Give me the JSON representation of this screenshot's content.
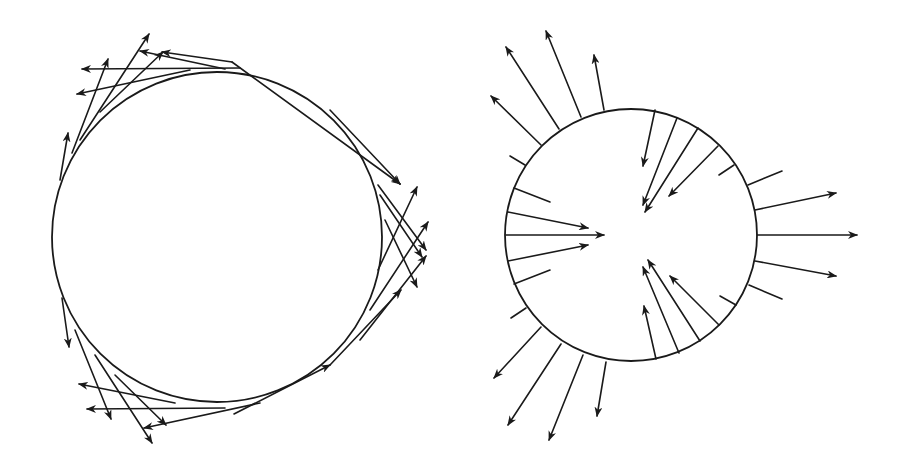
{
  "figure": {
    "background": "#ffffff",
    "stroke_color": "#1a1a1a",
    "panels": [
      {
        "name": "tangential-field",
        "circle": {
          "cx": 217,
          "cy": 237,
          "r": 165
        },
        "arrows": [
          {
            "x1": 240,
            "y1": 68,
            "x2": 82,
            "y2": 69
          },
          {
            "x1": 225,
            "y1": 69,
            "x2": 140,
            "y2": 51
          },
          {
            "x1": 190,
            "y1": 70,
            "x2": 77,
            "y2": 94
          },
          {
            "x1": 232,
            "y1": 62,
            "x2": 162,
            "y2": 52
          },
          {
            "x1": 100,
            "y1": 112,
            "x2": 163,
            "y2": 52
          },
          {
            "x1": 80,
            "y1": 140,
            "x2": 149,
            "y2": 34
          },
          {
            "x1": 72,
            "y1": 153,
            "x2": 108,
            "y2": 59
          },
          {
            "x1": 60,
            "y1": 180,
            "x2": 68,
            "y2": 133
          },
          {
            "x1": 232,
            "y1": 62,
            "x2": 400,
            "y2": 184
          },
          {
            "x1": 330,
            "y1": 110,
            "x2": 400,
            "y2": 184
          },
          {
            "x1": 380,
            "y1": 195,
            "x2": 422,
            "y2": 257
          },
          {
            "x1": 378,
            "y1": 185,
            "x2": 426,
            "y2": 250
          },
          {
            "x1": 385,
            "y1": 220,
            "x2": 417,
            "y2": 287
          },
          {
            "x1": 378,
            "y1": 270,
            "x2": 417,
            "y2": 187
          },
          {
            "x1": 370,
            "y1": 310,
            "x2": 428,
            "y2": 222
          },
          {
            "x1": 360,
            "y1": 340,
            "x2": 426,
            "y2": 256
          },
          {
            "x1": 330,
            "y1": 365,
            "x2": 401,
            "y2": 290
          },
          {
            "x1": 62,
            "y1": 298,
            "x2": 69,
            "y2": 347
          },
          {
            "x1": 75,
            "y1": 330,
            "x2": 111,
            "y2": 419
          },
          {
            "x1": 95,
            "y1": 355,
            "x2": 152,
            "y2": 443
          },
          {
            "x1": 115,
            "y1": 375,
            "x2": 166,
            "y2": 425
          },
          {
            "x1": 225,
            "y1": 408,
            "x2": 87,
            "y2": 409
          },
          {
            "x1": 175,
            "y1": 403,
            "x2": 79,
            "y2": 384
          },
          {
            "x1": 260,
            "y1": 403,
            "x2": 144,
            "y2": 428
          },
          {
            "x1": 234,
            "y1": 414,
            "x2": 330,
            "y2": 365
          }
        ]
      },
      {
        "name": "normal-field",
        "circle": {
          "cx": 631,
          "cy": 235,
          "r": 126
        },
        "arrows": [
          {
            "x1": 541,
            "y1": 145,
            "x2": 491,
            "y2": 96,
            "head": true
          },
          {
            "x1": 559,
            "y1": 129,
            "x2": 506,
            "y2": 47,
            "head": true
          },
          {
            "x1": 581,
            "y1": 117,
            "x2": 546,
            "y2": 31,
            "head": true
          },
          {
            "x1": 604,
            "y1": 110,
            "x2": 594,
            "y2": 55,
            "head": true
          },
          {
            "x1": 525,
            "y1": 165,
            "x2": 510,
            "y2": 156,
            "head": false
          },
          {
            "x1": 514,
            "y1": 188,
            "x2": 550,
            "y2": 202,
            "head": false
          },
          {
            "x1": 508,
            "y1": 212,
            "x2": 588,
            "y2": 228,
            "head": true
          },
          {
            "x1": 506,
            "y1": 235,
            "x2": 604,
            "y2": 235,
            "head": true
          },
          {
            "x1": 508,
            "y1": 261,
            "x2": 588,
            "y2": 245,
            "head": true
          },
          {
            "x1": 514,
            "y1": 284,
            "x2": 550,
            "y2": 270,
            "head": false
          },
          {
            "x1": 526,
            "y1": 308,
            "x2": 511,
            "y2": 318,
            "head": false
          },
          {
            "x1": 541,
            "y1": 327,
            "x2": 494,
            "y2": 378,
            "head": true
          },
          {
            "x1": 561,
            "y1": 344,
            "x2": 508,
            "y2": 425,
            "head": true
          },
          {
            "x1": 583,
            "y1": 355,
            "x2": 549,
            "y2": 440,
            "head": true
          },
          {
            "x1": 606,
            "y1": 362,
            "x2": 597,
            "y2": 416,
            "head": true
          },
          {
            "x1": 655,
            "y1": 110,
            "x2": 643,
            "y2": 166,
            "head": true
          },
          {
            "x1": 677,
            "y1": 118,
            "x2": 643,
            "y2": 205,
            "head": true
          },
          {
            "x1": 698,
            "y1": 128,
            "x2": 645,
            "y2": 212,
            "head": true
          },
          {
            "x1": 718,
            "y1": 146,
            "x2": 669,
            "y2": 196,
            "head": true
          },
          {
            "x1": 734,
            "y1": 165,
            "x2": 719,
            "y2": 175,
            "head": false
          },
          {
            "x1": 748,
            "y1": 185,
            "x2": 782,
            "y2": 171,
            "head": false
          },
          {
            "x1": 755,
            "y1": 210,
            "x2": 836,
            "y2": 193,
            "head": true
          },
          {
            "x1": 757,
            "y1": 235,
            "x2": 857,
            "y2": 235,
            "head": true
          },
          {
            "x1": 755,
            "y1": 261,
            "x2": 836,
            "y2": 276,
            "head": true
          },
          {
            "x1": 749,
            "y1": 285,
            "x2": 782,
            "y2": 299,
            "head": false
          },
          {
            "x1": 736,
            "y1": 305,
            "x2": 720,
            "y2": 296,
            "head": false
          },
          {
            "x1": 719,
            "y1": 325,
            "x2": 670,
            "y2": 276,
            "head": true
          },
          {
            "x1": 700,
            "y1": 341,
            "x2": 648,
            "y2": 260,
            "head": true
          },
          {
            "x1": 679,
            "y1": 353,
            "x2": 643,
            "y2": 267,
            "head": true
          },
          {
            "x1": 656,
            "y1": 359,
            "x2": 644,
            "y2": 306,
            "head": true
          }
        ]
      }
    ]
  }
}
